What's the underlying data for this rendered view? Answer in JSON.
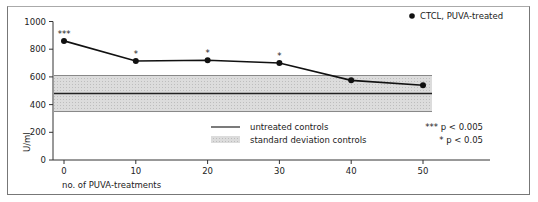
{
  "chart_data": {
    "type": "line",
    "title": "",
    "xlabel": "no. of PUVA-treatments",
    "ylabel": "U/ml",
    "x": [
      0,
      10,
      20,
      30,
      40,
      50
    ],
    "x_ticks": [
      "0",
      "10",
      "20",
      "30",
      "40",
      "50"
    ],
    "y_ticks": [
      "0",
      "200",
      "400",
      "600",
      "800",
      "1000"
    ],
    "ylim": [
      0,
      1000
    ],
    "xlim": [
      -2,
      56
    ],
    "grid": false,
    "series": [
      {
        "name": "CTCL, PUVA-treated",
        "values": [
          860,
          715,
          720,
          700,
          575,
          540
        ],
        "significance": [
          "***",
          "*",
          "*",
          "*",
          "",
          ""
        ]
      }
    ],
    "reference": {
      "untreated_controls_mean": 480,
      "standard_deviation_band": [
        350,
        610
      ]
    },
    "legend": {
      "series_label": "CTCL, PUVA-treated",
      "line_label": "untreated controls",
      "band_label": "standard deviation controls",
      "sig1_marker": "***",
      "sig1_label": "p < 0.005",
      "sig2_marker": "*",
      "sig2_label": "p < 0.05"
    }
  }
}
